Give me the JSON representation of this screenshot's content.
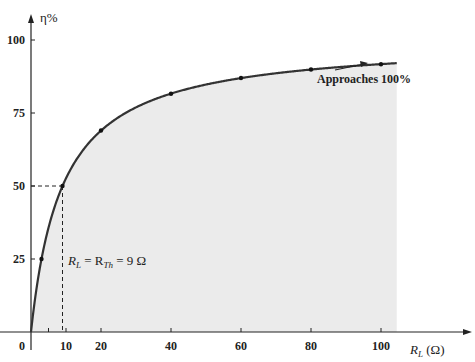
{
  "chart_data": {
    "type": "line",
    "title": "",
    "xlabel": "R_L (Ω)",
    "ylabel": "η%",
    "xlim": [
      0,
      105
    ],
    "ylim": [
      0,
      100
    ],
    "x_ticks": [
      0,
      10,
      20,
      40,
      60,
      80,
      100
    ],
    "y_ticks": [
      25,
      50,
      75,
      100
    ],
    "x_tick_labels": [
      "0",
      "10",
      "20",
      "40",
      "60",
      "80",
      "100"
    ],
    "y_tick_labels": [
      "25",
      "50",
      "75",
      "100"
    ],
    "grid": false,
    "series": [
      {
        "name": "Efficiency η% = R_L / (R_L + R_Th) × 100",
        "x": [
          0,
          3,
          9,
          20,
          40,
          60,
          80,
          100
        ],
        "values": [
          0,
          25,
          50,
          69,
          81.6,
          87,
          89.9,
          91.7
        ],
        "markers": [
          false,
          true,
          true,
          true,
          true,
          true,
          true,
          true
        ]
      }
    ],
    "annotations": [
      {
        "text": "Approaches 100%",
        "x": 90,
        "y": 83,
        "arrow": true
      },
      {
        "text": "R_L = R_Th = 9 Ω",
        "x": 10,
        "y": 25,
        "dashed_guide": {
          "x": 9,
          "y": 50
        }
      }
    ],
    "shaded_area": {
      "under_curve": true,
      "x_range": [
        0,
        104.5
      ],
      "color": "#ebebeb"
    },
    "colors": {
      "curve": "#333333",
      "fill": "#ebebeb",
      "axis": "#222222"
    }
  },
  "labels": {
    "y_axis_title": "η%",
    "x_axis_title_main": "R",
    "x_axis_title_sub": "L",
    "x_axis_title_unit": " (Ω)",
    "approaches": "Approaches 100%",
    "rl_main": "R",
    "rl_sub": "L",
    "eq1": " = R",
    "rth_sub": "Th",
    "eq2": " = 9 Ω"
  }
}
